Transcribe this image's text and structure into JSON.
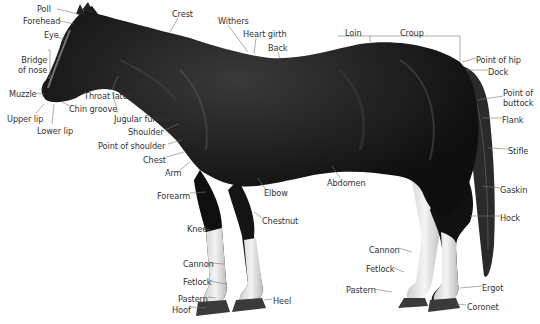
{
  "diagram": {
    "colors": {
      "coat": "#141414",
      "highlight": "#5a5a5a",
      "socks": "#e8e8e8",
      "hoof": "#3a3a3a",
      "leader": "#666666",
      "text": "#333333"
    },
    "labels": [
      {
        "id": "poll",
        "text": "Poll",
        "x": 37,
        "y": 4,
        "align": "left"
      },
      {
        "id": "forehead",
        "text": "Forehead",
        "x": 23,
        "y": 16,
        "align": "left"
      },
      {
        "id": "eye",
        "text": "Eye",
        "x": 44,
        "y": 30,
        "align": "left"
      },
      {
        "id": "bridge-of-nose",
        "text": "Bridge\nof nose",
        "x": 18,
        "y": 55,
        "align": "right"
      },
      {
        "id": "muzzle",
        "text": "Muzzle",
        "x": 9,
        "y": 89,
        "align": "left"
      },
      {
        "id": "throat-latch",
        "text": "Throat latch",
        "x": 84,
        "y": 91,
        "align": "left"
      },
      {
        "id": "chin-groove",
        "text": "Chin groove",
        "x": 69,
        "y": 104,
        "align": "left"
      },
      {
        "id": "upper-lip",
        "text": "Upper lip",
        "x": 7,
        "y": 114,
        "align": "left"
      },
      {
        "id": "jugular-furrow",
        "text": "Jugular furrow",
        "x": 114,
        "y": 114,
        "align": "left"
      },
      {
        "id": "lower-lip",
        "text": "Lower lip",
        "x": 37,
        "y": 126,
        "align": "left"
      },
      {
        "id": "shoulder",
        "text": "Shoulder",
        "x": 128,
        "y": 127,
        "align": "left"
      },
      {
        "id": "point-of-shoulder",
        "text": "Point of shoulder",
        "x": 98,
        "y": 141,
        "align": "left"
      },
      {
        "id": "chest",
        "text": "Chest",
        "x": 143,
        "y": 155,
        "align": "left"
      },
      {
        "id": "arm",
        "text": "Arm",
        "x": 165,
        "y": 168,
        "align": "left"
      },
      {
        "id": "forearm",
        "text": "Forearm",
        "x": 157,
        "y": 191,
        "align": "left"
      },
      {
        "id": "crest",
        "text": "Crest",
        "x": 172,
        "y": 9,
        "align": "left"
      },
      {
        "id": "withers",
        "text": "Withers",
        "x": 218,
        "y": 16,
        "align": "left"
      },
      {
        "id": "heart-girth",
        "text": "Heart girth",
        "x": 243,
        "y": 29,
        "align": "left"
      },
      {
        "id": "back",
        "text": "Back",
        "x": 268,
        "y": 43,
        "align": "left"
      },
      {
        "id": "loin",
        "text": "Loin",
        "x": 345,
        "y": 28,
        "align": "left"
      },
      {
        "id": "croup",
        "text": "Croup",
        "x": 400,
        "y": 28,
        "align": "left"
      },
      {
        "id": "point-of-hip",
        "text": "Point of hip",
        "x": 476,
        "y": 55,
        "align": "left"
      },
      {
        "id": "dock",
        "text": "Dock",
        "x": 488,
        "y": 67,
        "align": "left"
      },
      {
        "id": "point-of-buttock",
        "text": "Point of\nbuttock",
        "x": 503,
        "y": 88,
        "align": "left"
      },
      {
        "id": "flank",
        "text": "Flank",
        "x": 502,
        "y": 115,
        "align": "left"
      },
      {
        "id": "stifle",
        "text": "Stifle",
        "x": 508,
        "y": 146,
        "align": "left"
      },
      {
        "id": "abdomen",
        "text": "Abdomen",
        "x": 327,
        "y": 178,
        "align": "left"
      },
      {
        "id": "elbow",
        "text": "Elbow",
        "x": 264,
        "y": 188,
        "align": "left"
      },
      {
        "id": "gaskin",
        "text": "Gaskin",
        "x": 500,
        "y": 185,
        "align": "left"
      },
      {
        "id": "chestnut",
        "text": "Chestnut",
        "x": 262,
        "y": 216,
        "align": "left"
      },
      {
        "id": "hock",
        "text": "Hock",
        "x": 500,
        "y": 213,
        "align": "left"
      },
      {
        "id": "knee",
        "text": "Knee",
        "x": 187,
        "y": 224,
        "align": "left"
      },
      {
        "id": "cannon-hind",
        "text": "Cannon",
        "x": 369,
        "y": 245,
        "align": "left"
      },
      {
        "id": "cannon-fore",
        "text": "Cannon",
        "x": 183,
        "y": 259,
        "align": "left"
      },
      {
        "id": "fetlock-hind",
        "text": "Fetlock",
        "x": 366,
        "y": 264,
        "align": "left"
      },
      {
        "id": "fetlock-fore",
        "text": "Fetlock",
        "x": 183,
        "y": 277,
        "align": "left"
      },
      {
        "id": "ergot",
        "text": "Ergot",
        "x": 482,
        "y": 283,
        "align": "left"
      },
      {
        "id": "pastern-hind",
        "text": "Pastern",
        "x": 346,
        "y": 285,
        "align": "left"
      },
      {
        "id": "pastern-fore",
        "text": "Pastern",
        "x": 178,
        "y": 294,
        "align": "left"
      },
      {
        "id": "heel",
        "text": "Heel",
        "x": 273,
        "y": 296,
        "align": "left"
      },
      {
        "id": "coronet",
        "text": "Coronet",
        "x": 467,
        "y": 302,
        "align": "left"
      },
      {
        "id": "hoof",
        "text": "Hoof",
        "x": 172,
        "y": 305,
        "align": "left"
      }
    ]
  }
}
